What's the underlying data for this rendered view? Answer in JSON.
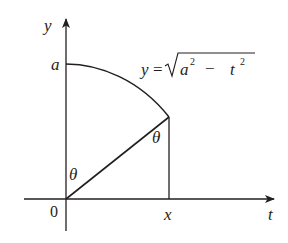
{
  "diagram": {
    "type": "geometry-graph",
    "axes": {
      "vertical_label": "y",
      "horizontal_label": "t",
      "origin_label": "0"
    },
    "labels": {
      "y_intercept": "a",
      "x_position": "x",
      "angle_at_origin": "θ",
      "angle_at_point": "θ"
    },
    "equation": {
      "lhs": "y",
      "equals": "=",
      "radicand_a": "a",
      "exp1": "2",
      "minus": "−",
      "radicand_t": "t",
      "exp2": "2"
    },
    "colors": {
      "stroke": "#231f20",
      "background": "#ffffff"
    }
  }
}
